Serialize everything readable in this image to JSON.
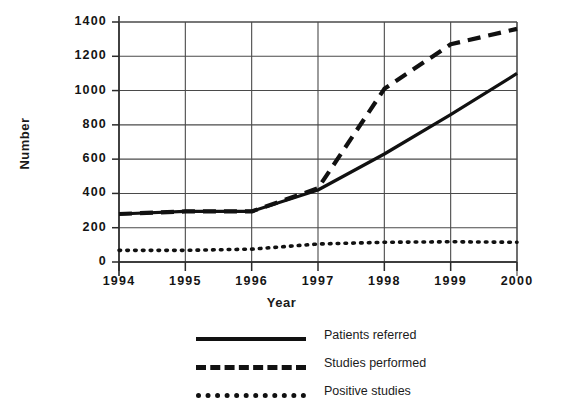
{
  "chart_data": {
    "type": "line",
    "title": "",
    "xlabel": "Year",
    "ylabel": "Number",
    "categories": [
      "1994",
      "1995",
      "1996",
      "1997",
      "1998",
      "1999",
      "2000"
    ],
    "x": [
      1994,
      1995,
      1996,
      1997,
      1998,
      1999,
      2000
    ],
    "xlim": [
      1994,
      2000
    ],
    "ylim": [
      0,
      1400
    ],
    "yticks": [
      "0",
      "200",
      "400",
      "600",
      "800",
      "1000",
      "1200",
      "1400"
    ],
    "ytick_values": [
      0,
      200,
      400,
      600,
      800,
      1000,
      1200,
      1400
    ],
    "grid": true,
    "legend_position": "bottom-center",
    "series": [
      {
        "name": "Patients referred",
        "style": "solid",
        "color": "#111111",
        "values": [
          280,
          295,
          295,
          420,
          630,
          860,
          1100
        ]
      },
      {
        "name": "Studies performed",
        "style": "dashed",
        "color": "#111111",
        "values": [
          280,
          295,
          295,
          430,
          1010,
          1270,
          1360
        ]
      },
      {
        "name": "Positive studies",
        "style": "dotted",
        "color": "#111111",
        "values": [
          68,
          68,
          75,
          105,
          115,
          118,
          115
        ]
      }
    ]
  },
  "legend": {
    "items": [
      {
        "label": "Patients referred",
        "key": "solid-line-key"
      },
      {
        "label": "Studies performed",
        "key": "dashed-line-key"
      },
      {
        "label": "Positive studies",
        "key": "dotted-line-key"
      }
    ]
  }
}
